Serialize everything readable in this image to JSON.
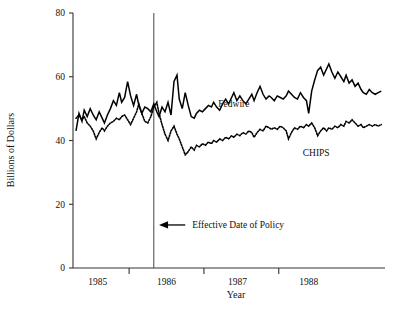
{
  "chart_data": {
    "type": "line",
    "title": "",
    "xlabel": "Year",
    "ylabel": "Billions of Dollars",
    "ylim": [
      0,
      80
    ],
    "yticks": [
      0,
      20,
      40,
      60,
      80
    ],
    "ytick_labels": [
      "0",
      "20",
      "40",
      "60",
      "80"
    ],
    "xlim": [
      1984.75,
      1988.92
    ],
    "xtick_positions": [
      1985.5,
      1986.5,
      1987.5
    ],
    "xtick_labels": [
      "1985",
      "1986",
      "1987",
      "1988"
    ],
    "xtick_label_positions": [
      1985.08,
      1986.0,
      1986.95,
      1987.9
    ],
    "grid": false,
    "legend_position": "inline-annotations",
    "annotations": [
      {
        "name": "effective-date-of-policy",
        "text": "Effective Date of Policy",
        "arrow_from_x": 1986.25,
        "arrow_to_x": 1985.9,
        "y": 13.5,
        "vline_x": 1985.83
      }
    ],
    "vertical_line": {
      "label": "Effective Date of Policy",
      "x": 1985.83
    },
    "series": [
      {
        "name": "Fedwire",
        "style": "solid",
        "label_x": 1986.9,
        "label_y": 50.5,
        "x": [
          1984.79,
          1984.83,
          1984.87,
          1984.9,
          1984.94,
          1984.98,
          1985.02,
          1985.06,
          1985.1,
          1985.14,
          1985.17,
          1985.21,
          1985.25,
          1985.29,
          1985.33,
          1985.37,
          1985.4,
          1985.44,
          1985.48,
          1985.52,
          1985.56,
          1985.6,
          1985.63,
          1985.67,
          1985.71,
          1985.75,
          1985.79,
          1985.83,
          1985.87,
          1985.9,
          1985.94,
          1985.98,
          1986.02,
          1986.06,
          1986.1,
          1986.14,
          1986.17,
          1986.21,
          1986.25,
          1986.29,
          1986.33,
          1986.37,
          1986.4,
          1986.44,
          1986.48,
          1986.52,
          1986.56,
          1986.6,
          1986.63,
          1986.67,
          1986.71,
          1986.75,
          1986.79,
          1986.83,
          1986.87,
          1986.9,
          1986.94,
          1986.98,
          1987.02,
          1987.06,
          1987.1,
          1987.14,
          1987.17,
          1987.21,
          1987.25,
          1987.29,
          1987.33,
          1987.37,
          1987.4,
          1987.44,
          1987.48,
          1987.52,
          1987.56,
          1987.6,
          1987.63,
          1987.67,
          1987.71,
          1987.75,
          1987.79,
          1987.83,
          1987.87,
          1987.9,
          1987.94,
          1987.98,
          1988.02,
          1988.06,
          1988.1,
          1988.14,
          1988.17,
          1988.21,
          1988.25,
          1988.29,
          1988.33,
          1988.37,
          1988.4,
          1988.44,
          1988.48,
          1988.52,
          1988.56,
          1988.6,
          1988.63,
          1988.67,
          1988.71,
          1988.75,
          1988.79,
          1988.83,
          1988.87
        ],
        "y": [
          43.0,
          48.5,
          46.0,
          49.5,
          47.5,
          50.0,
          48.0,
          46.5,
          49.0,
          47.0,
          45.5,
          48.0,
          50.0,
          52.5,
          51.0,
          55.0,
          52.0,
          53.5,
          58.5,
          54.0,
          51.0,
          54.5,
          51.0,
          48.5,
          50.5,
          50.0,
          49.0,
          51.5,
          49.0,
          47.5,
          50.5,
          49.0,
          52.0,
          48.0,
          58.5,
          60.5,
          53.0,
          50.0,
          55.0,
          51.0,
          47.5,
          47.0,
          48.5,
          49.5,
          49.0,
          50.0,
          51.0,
          50.5,
          52.0,
          50.5,
          49.5,
          51.5,
          53.0,
          51.5,
          53.5,
          55.0,
          52.5,
          54.0,
          52.5,
          51.5,
          53.0,
          54.5,
          52.5,
          55.0,
          57.0,
          54.5,
          53.0,
          54.0,
          53.5,
          52.5,
          54.0,
          53.5,
          53.0,
          54.0,
          55.5,
          54.5,
          53.5,
          53.0,
          55.0,
          53.5,
          52.5,
          48.5,
          55.5,
          59.0,
          62.0,
          63.0,
          60.5,
          62.5,
          64.0,
          61.5,
          59.5,
          61.5,
          60.0,
          58.5,
          60.5,
          58.0,
          59.0,
          57.0,
          58.0,
          56.0,
          55.0,
          54.5,
          56.0,
          55.0,
          54.5,
          55.0,
          55.5
        ]
      },
      {
        "name": "CHIPS",
        "style": "dotted",
        "label_x": 1988.0,
        "label_y": 35.0,
        "x": [
          1984.79,
          1984.83,
          1984.87,
          1984.9,
          1984.94,
          1984.98,
          1985.02,
          1985.06,
          1985.1,
          1985.14,
          1985.17,
          1985.21,
          1985.25,
          1985.29,
          1985.33,
          1985.37,
          1985.4,
          1985.44,
          1985.48,
          1985.52,
          1985.56,
          1985.6,
          1985.63,
          1985.67,
          1985.71,
          1985.75,
          1985.79,
          1985.83,
          1985.87,
          1985.9,
          1985.94,
          1985.98,
          1986.02,
          1986.06,
          1986.1,
          1986.14,
          1986.17,
          1986.21,
          1986.25,
          1986.29,
          1986.33,
          1986.37,
          1986.4,
          1986.44,
          1986.48,
          1986.52,
          1986.56,
          1986.6,
          1986.63,
          1986.67,
          1986.71,
          1986.75,
          1986.79,
          1986.83,
          1986.87,
          1986.9,
          1986.94,
          1986.98,
          1987.02,
          1987.06,
          1987.1,
          1987.14,
          1987.17,
          1987.21,
          1987.25,
          1987.29,
          1987.33,
          1987.37,
          1987.4,
          1987.44,
          1987.48,
          1987.52,
          1987.56,
          1987.6,
          1987.63,
          1987.67,
          1987.71,
          1987.75,
          1987.79,
          1987.83,
          1987.87,
          1987.9,
          1987.94,
          1987.98,
          1988.02,
          1988.06,
          1988.1,
          1988.14,
          1988.17,
          1988.21,
          1988.25,
          1988.29,
          1988.33,
          1988.37,
          1988.4,
          1988.44,
          1988.48,
          1988.52,
          1988.56,
          1988.6,
          1988.63,
          1988.67,
          1988.71,
          1988.75,
          1988.79,
          1988.83,
          1988.87
        ],
        "y": [
          47.0,
          48.0,
          46.5,
          47.5,
          45.5,
          44.5,
          43.0,
          40.5,
          42.5,
          44.0,
          43.0,
          44.5,
          45.5,
          46.0,
          47.0,
          46.5,
          47.5,
          48.0,
          46.5,
          45.0,
          47.0,
          49.0,
          51.5,
          48.5,
          46.0,
          45.5,
          47.5,
          50.5,
          52.0,
          48.5,
          45.0,
          42.0,
          40.0,
          43.0,
          44.5,
          42.0,
          40.5,
          38.0,
          35.5,
          36.5,
          38.0,
          37.0,
          38.5,
          38.0,
          39.0,
          38.5,
          39.5,
          39.0,
          40.0,
          39.5,
          40.5,
          40.0,
          41.0,
          40.5,
          41.5,
          41.0,
          42.0,
          41.5,
          42.5,
          42.0,
          43.0,
          42.5,
          41.0,
          42.5,
          43.5,
          43.0,
          44.5,
          44.0,
          43.5,
          44.0,
          43.5,
          44.5,
          44.0,
          43.0,
          40.5,
          42.5,
          44.0,
          43.5,
          44.5,
          44.0,
          45.0,
          44.5,
          45.5,
          44.0,
          41.5,
          43.0,
          44.0,
          43.0,
          44.0,
          43.5,
          44.5,
          44.0,
          45.0,
          44.5,
          46.0,
          45.5,
          46.5,
          45.5,
          44.5,
          45.0,
          44.0,
          44.5,
          45.0,
          44.5,
          45.0,
          44.5,
          45.0
        ]
      }
    ]
  }
}
